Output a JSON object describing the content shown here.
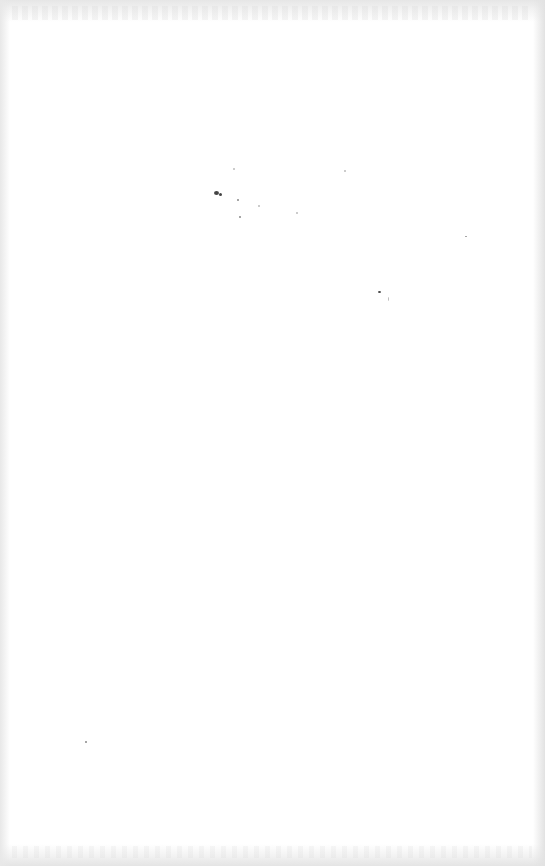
{
  "document": {
    "type": "blank scanned page",
    "background_color": "#ffffff",
    "text_content": []
  },
  "artifacts": {
    "specks": [
      {
        "x": 214,
        "y": 191,
        "w": 5,
        "h": 4,
        "tone": "dark"
      },
      {
        "x": 219,
        "y": 193,
        "w": 3,
        "h": 3,
        "tone": "dark"
      },
      {
        "x": 237,
        "y": 199,
        "w": 2,
        "h": 2,
        "tone": "mid"
      },
      {
        "x": 239,
        "y": 216,
        "w": 2,
        "h": 2,
        "tone": "mid"
      },
      {
        "x": 233,
        "y": 168,
        "w": 2,
        "h": 2,
        "tone": "light"
      },
      {
        "x": 258,
        "y": 205,
        "w": 2,
        "h": 2,
        "tone": "light"
      },
      {
        "x": 296,
        "y": 212,
        "w": 2,
        "h": 2,
        "tone": "light"
      },
      {
        "x": 344,
        "y": 170,
        "w": 2,
        "h": 2,
        "tone": "light"
      },
      {
        "x": 378,
        "y": 291,
        "w": 3,
        "h": 2,
        "tone": "dark"
      },
      {
        "x": 388,
        "y": 297,
        "w": 1,
        "h": 4,
        "tone": "light"
      },
      {
        "x": 465,
        "y": 236,
        "w": 2,
        "h": 1,
        "tone": "mid"
      },
      {
        "x": 85,
        "y": 741,
        "w": 2,
        "h": 2,
        "tone": "mid"
      }
    ]
  }
}
